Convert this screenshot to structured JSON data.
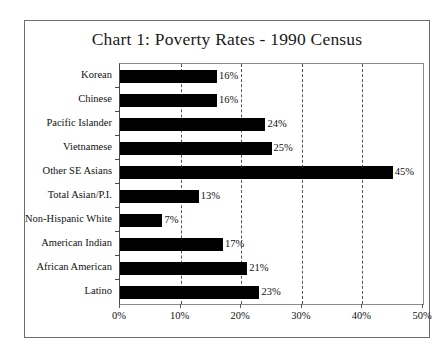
{
  "chart_data": {
    "type": "bar",
    "orientation": "horizontal",
    "title": "Chart 1: Poverty Rates - 1990 Census",
    "xlabel": "",
    "ylabel": "",
    "categories": [
      "Korean",
      "Chinese",
      "Pacific Islander",
      "Vietnamese",
      "Other SE Asians",
      "Total Asian/P.I.",
      "Non-Hispanic White",
      "American Indian",
      "African American",
      "Latino"
    ],
    "values": [
      16,
      16,
      24,
      25,
      45,
      13,
      7,
      17,
      21,
      23
    ],
    "value_labels": [
      "16%",
      "16%",
      "24%",
      "25%",
      "45%",
      "13%",
      "7%",
      "17%",
      "21%",
      "23%"
    ],
    "xlim": [
      0,
      50
    ],
    "xticks": [
      0,
      10,
      20,
      30,
      40,
      50
    ],
    "xtick_labels": [
      "0%",
      "10%",
      "20%",
      "30%",
      "40%",
      "50%"
    ],
    "grid": true,
    "grid_axis": "x",
    "grid_style": "dashed",
    "legend": false,
    "bar_color": "#000000",
    "background_color": "#ffffff",
    "frame_color": "#6d6d6d"
  }
}
